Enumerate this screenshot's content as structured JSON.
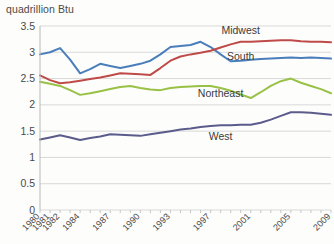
{
  "axis_title": "quadrillion Btu",
  "chart_data": {
    "type": "line",
    "title": "",
    "subtitle": "",
    "xlabel": "",
    "ylabel": "quadrillion Btu",
    "ylim": [
      0,
      3.5
    ],
    "ytick_labels": [
      "3.5",
      "3",
      "2.5",
      "2",
      "1.5",
      "1",
      "0.5",
      "0"
    ],
    "ytick_values": [
      3.5,
      3,
      2.5,
      2,
      1.5,
      1,
      0.5,
      0
    ],
    "grid": true,
    "legend_position": "inline-labels",
    "x": [
      1980,
      1981,
      1982,
      1983,
      1984,
      1985,
      1986,
      1987,
      1988,
      1989,
      1990,
      1991,
      1992,
      1993,
      1994,
      1995,
      1996,
      1997,
      1998,
      1999,
      2000,
      2001,
      2002,
      2003,
      2004,
      2005,
      2006,
      2007,
      2008,
      2009
    ],
    "xtick_labels": [
      "1980",
      "1981",
      "1982",
      "1984",
      "1987",
      "1990",
      "1993",
      "1997",
      "2001",
      "2005",
      "2009"
    ],
    "xtick_values": [
      1980,
      1981,
      1982,
      1984,
      1987,
      1990,
      1993,
      1997,
      2001,
      2005,
      2009
    ],
    "series": [
      {
        "name": "Midwest",
        "color": "#4A7EBB",
        "label_x": 2000,
        "label_y": 3.34,
        "values": [
          2.96,
          3.0,
          3.08,
          2.86,
          2.6,
          2.68,
          2.78,
          2.74,
          2.7,
          2.74,
          2.78,
          2.84,
          2.96,
          3.1,
          3.12,
          3.14,
          3.2,
          3.1,
          2.96,
          2.83,
          2.84,
          2.86,
          2.87,
          2.88,
          2.89,
          2.9,
          2.89,
          2.9,
          2.89,
          2.88
        ]
      },
      {
        "name": "South",
        "color": "#BE4B48",
        "label_x": 2000,
        "label_y": 2.86,
        "values": [
          2.56,
          2.47,
          2.41,
          2.43,
          2.46,
          2.49,
          2.52,
          2.56,
          2.6,
          2.59,
          2.58,
          2.57,
          2.7,
          2.84,
          2.92,
          2.96,
          2.99,
          3.03,
          3.09,
          3.15,
          3.2,
          3.2,
          3.21,
          3.22,
          3.23,
          3.23,
          3.21,
          3.2,
          3.2,
          3.19
        ]
      },
      {
        "name": "Northeast",
        "color": "#98C145",
        "label_x": 1998,
        "label_y": 2.14,
        "values": [
          2.44,
          2.4,
          2.36,
          2.28,
          2.19,
          2.22,
          2.26,
          2.3,
          2.34,
          2.36,
          2.32,
          2.29,
          2.28,
          2.32,
          2.34,
          2.35,
          2.36,
          2.36,
          2.32,
          2.27,
          2.2,
          2.13,
          2.24,
          2.36,
          2.45,
          2.5,
          2.42,
          2.36,
          2.3,
          2.22
        ]
      },
      {
        "name": "West",
        "color": "#5B5B8C",
        "label_x": 1998,
        "label_y": 1.34,
        "values": [
          1.34,
          1.38,
          1.42,
          1.38,
          1.33,
          1.37,
          1.4,
          1.44,
          1.43,
          1.42,
          1.41,
          1.44,
          1.47,
          1.5,
          1.53,
          1.55,
          1.58,
          1.6,
          1.61,
          1.61,
          1.62,
          1.62,
          1.66,
          1.72,
          1.79,
          1.86,
          1.86,
          1.85,
          1.83,
          1.81
        ]
      }
    ]
  }
}
